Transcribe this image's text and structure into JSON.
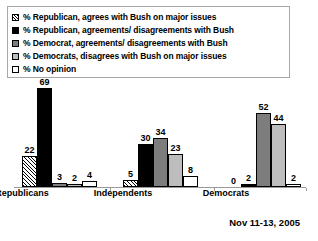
{
  "chart_data": {
    "type": "bar",
    "title": "",
    "subtitle": "",
    "xlabel": "",
    "ylabel": "",
    "ylim": [
      0,
      72
    ],
    "grid": false,
    "legend_position": "top-left",
    "annotation": "Nov 11-13, 2005",
    "categories": [
      "Republicans",
      "Independents",
      "Democrats"
    ],
    "series": [
      {
        "name": "% Republican, agrees with Bush on major issues",
        "swatch": "hatch",
        "values": [
          22,
          5,
          0
        ]
      },
      {
        "name": "% Republican, agreements/ disagreements with Bush",
        "swatch": "black",
        "values": [
          69,
          30,
          2
        ]
      },
      {
        "name": "% Democrat, agreements/ disagreements with Bush",
        "swatch": "dark-gray",
        "values": [
          3,
          34,
          52
        ]
      },
      {
        "name": "% Democrats, disagrees with Bush on major issues",
        "swatch": "light-gray",
        "values": [
          2,
          23,
          44
        ]
      },
      {
        "name": "% No opinion",
        "swatch": "white",
        "values": [
          4,
          8,
          2
        ]
      }
    ]
  },
  "legend": {
    "items": [
      {
        "label": "% Republican, agrees with Bush on major issues",
        "swatch": "hatch"
      },
      {
        "label": "% Republican, agreements/ disagreements with Bush",
        "swatch": "black"
      },
      {
        "label": "% Democrat, agreements/ disagreements with Bush",
        "swatch": "dark-gray"
      },
      {
        "label": "% Democrats, disagrees with Bush on major issues",
        "swatch": "light-gray"
      },
      {
        "label": "% No opinion",
        "swatch": "white"
      }
    ]
  },
  "footer": {
    "date": "Nov 11-13, 2005"
  },
  "colors": {
    "series_black": "#000000",
    "series_dark_gray": "#7d7d7d",
    "series_light_gray": "#bdbdbd",
    "series_white": "#ffffff",
    "axis": "#999999",
    "legend_border": "#a8a8a8",
    "background": "#ffffff"
  }
}
